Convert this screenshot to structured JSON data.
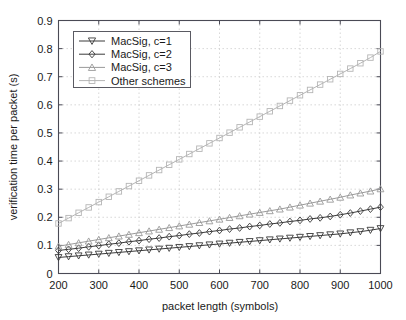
{
  "chart_data": {
    "type": "line",
    "title": "",
    "xlabel": "packet length (symbols)",
    "ylabel": "verification time per packet (s)",
    "xlim": [
      200,
      1000
    ],
    "ylim": [
      0,
      0.9
    ],
    "xticks": [
      200,
      300,
      400,
      500,
      600,
      700,
      800,
      900,
      1000
    ],
    "xticklabels": [
      "200",
      "300",
      "400",
      "500",
      "600",
      "700",
      "800",
      "900",
      "1000"
    ],
    "yticks": [
      0,
      0.1,
      0.2,
      0.3,
      0.4,
      0.5,
      0.6,
      0.7,
      0.8,
      0.9
    ],
    "yticklabels": [
      "0",
      "0.1",
      "0.2",
      "0.3",
      "0.4",
      "0.5",
      "0.6",
      "0.7",
      "0.8",
      "0.9"
    ],
    "grid": true,
    "grid_style": "dotted",
    "legend_position": "upper left",
    "x": [
      200,
      225,
      250,
      275,
      300,
      325,
      350,
      375,
      400,
      425,
      450,
      475,
      500,
      525,
      550,
      575,
      600,
      625,
      650,
      675,
      700,
      725,
      750,
      775,
      800,
      825,
      850,
      875,
      900,
      925,
      950,
      975,
      1000
    ],
    "series": [
      {
        "name": "MacSig, c=1",
        "marker": "triangle-down",
        "color": "#3a3a3a",
        "values": [
          0.057,
          0.06,
          0.063,
          0.066,
          0.069,
          0.072,
          0.075,
          0.078,
          0.081,
          0.084,
          0.087,
          0.09,
          0.093,
          0.096,
          0.099,
          0.102,
          0.105,
          0.108,
          0.111,
          0.114,
          0.117,
          0.12,
          0.123,
          0.126,
          0.129,
          0.132,
          0.135,
          0.138,
          0.141,
          0.145,
          0.149,
          0.154,
          0.16
        ]
      },
      {
        "name": "MacSig, c=2",
        "marker": "diamond",
        "color": "#3a3a3a",
        "values": [
          0.082,
          0.086,
          0.09,
          0.095,
          0.099,
          0.104,
          0.108,
          0.113,
          0.117,
          0.122,
          0.126,
          0.131,
          0.135,
          0.14,
          0.144,
          0.149,
          0.153,
          0.158,
          0.162,
          0.167,
          0.171,
          0.176,
          0.18,
          0.185,
          0.189,
          0.194,
          0.198,
          0.203,
          0.209,
          0.215,
          0.222,
          0.229,
          0.236
        ]
      },
      {
        "name": "MacSig, c=3",
        "marker": "triangle-up",
        "color": "#9a9a9a",
        "values": [
          0.097,
          0.103,
          0.109,
          0.115,
          0.121,
          0.127,
          0.133,
          0.139,
          0.145,
          0.151,
          0.157,
          0.163,
          0.169,
          0.175,
          0.181,
          0.187,
          0.193,
          0.199,
          0.205,
          0.211,
          0.217,
          0.223,
          0.229,
          0.236,
          0.243,
          0.25,
          0.257,
          0.264,
          0.271,
          0.279,
          0.286,
          0.293,
          0.301
        ]
      },
      {
        "name": "Other schemes",
        "marker": "square",
        "color": "#b5b5b5",
        "values": [
          0.178,
          0.197,
          0.216,
          0.235,
          0.254,
          0.273,
          0.292,
          0.311,
          0.33,
          0.349,
          0.368,
          0.387,
          0.406,
          0.425,
          0.444,
          0.463,
          0.482,
          0.501,
          0.52,
          0.539,
          0.558,
          0.577,
          0.596,
          0.615,
          0.634,
          0.653,
          0.672,
          0.691,
          0.71,
          0.729,
          0.748,
          0.768,
          0.79
        ]
      }
    ]
  },
  "legend": {
    "entries": [
      {
        "label": "MacSig, c=1"
      },
      {
        "label": "MacSig, c=2"
      },
      {
        "label": "MacSig, c=3"
      },
      {
        "label": "Other schemes"
      }
    ]
  },
  "axes": {
    "xlabel": "packet length (symbols)",
    "ylabel": "verification time per packet (s)"
  },
  "colors": {
    "frame": "#4a4a55",
    "grid": "#c9c9c9",
    "series1": "#3a3a3a",
    "series2": "#3a3a3a",
    "series3": "#9a9a9a",
    "series4": "#b5b5b5",
    "background": "#ffffff"
  }
}
